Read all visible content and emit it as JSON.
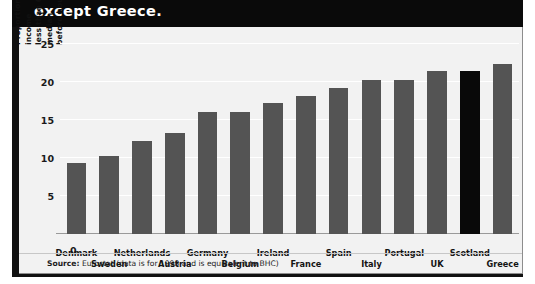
{
  "headline": "except Greece.",
  "source": {
    "prefix": "Source:",
    "text": "Eurostat (data is for 1998 and is equivalent to BHC)"
  },
  "colors": {
    "bar": "#545454",
    "bar_highlight": "#090909",
    "panel_background": "#f2f2f2",
    "headline_band": "#0a0a0a",
    "gridline": "#ffffff",
    "text": "#141414"
  },
  "chart_data": {
    "type": "bar",
    "title": "except Greece.",
    "xlabel": "",
    "ylabel": "Proportion of the population with an income less than 60 per cent of the national median before housing costs (per cent)",
    "ylabel_lines": [
      "Proportion of the population with an income",
      "less than 60 per cent of the national median",
      "before housing costs (per cent)"
    ],
    "ylim": [
      0,
      25
    ],
    "yticks": [
      0,
      5,
      10,
      15,
      20,
      25
    ],
    "ytick_labels": [
      "0",
      "5",
      "10",
      "15",
      "20",
      "25"
    ],
    "grid": true,
    "legend": "none",
    "categories": [
      "Denmark",
      "Sweden",
      "Netherlands",
      "Austria",
      "Germany",
      "Belgium",
      "Ireland",
      "France",
      "Spain",
      "Italy",
      "Portugal",
      "UK",
      "Scotland",
      "Greece"
    ],
    "values": [
      9.3,
      10.3,
      12.3,
      13.3,
      16.1,
      16.1,
      17.3,
      18.2,
      19.2,
      20.3,
      20.3,
      21.5,
      21.5,
      22.4
    ],
    "highlighted_category": "Scotland",
    "label_rows": [
      "top",
      "bottom",
      "top",
      "bottom",
      "top",
      "bottom",
      "top",
      "bottom",
      "top",
      "bottom",
      "top",
      "bottom",
      "top",
      "bottom"
    ]
  }
}
